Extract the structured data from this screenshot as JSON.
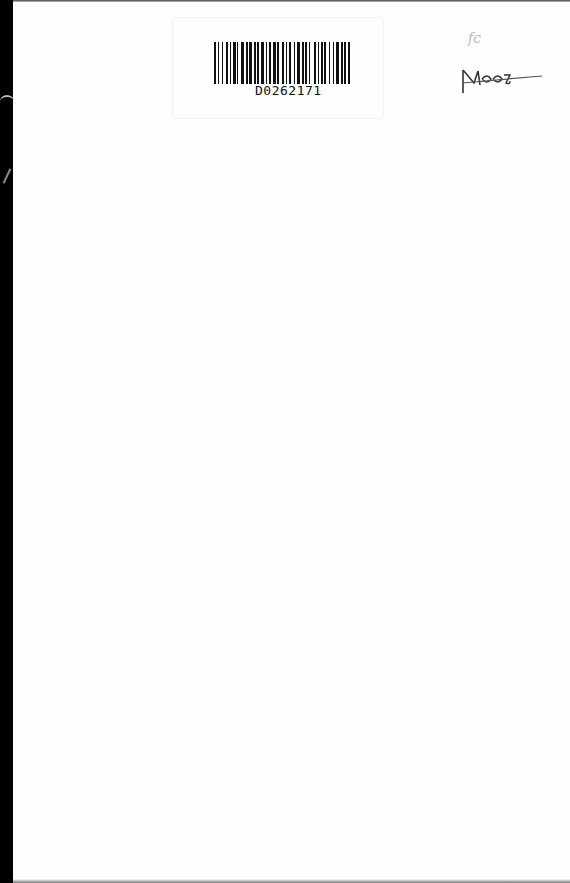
{
  "document": {
    "barcode": {
      "value": "D0262171",
      "pattern": [
        3,
        2,
        2,
        4,
        2,
        4,
        3,
        2,
        2,
        3,
        3,
        2,
        2,
        3,
        5,
        2,
        3,
        2,
        4,
        2,
        3,
        2,
        2,
        3,
        5,
        2,
        2,
        3,
        2,
        3,
        4,
        2,
        3,
        4,
        3,
        2,
        2,
        3,
        2,
        4,
        2,
        3,
        3,
        4,
        2,
        2,
        3,
        2,
        2,
        5,
        3,
        2,
        2,
        3,
        2,
        2,
        3,
        4,
        2,
        3,
        2,
        3,
        4,
        2,
        3,
        2,
        2,
        3,
        3
      ]
    },
    "annotations": {
      "small_note": "fc",
      "shelf_mark": "M400"
    },
    "colors": {
      "edge": "#000000",
      "paper": "#fefefe",
      "ink": "#111111"
    }
  }
}
